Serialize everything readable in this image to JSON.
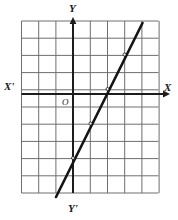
{
  "figure": {
    "kind": "coordinate-plane-line-graph",
    "title": "",
    "background_color": "#ffffff",
    "grid": {
      "line_color": "#6e6e6e",
      "line_width": 1,
      "cell_size_px": 17.2,
      "columns": 8,
      "rows": 10,
      "bounds_px": {
        "left": 21.5,
        "top": 21.0,
        "right": 158.5,
        "bottom": 193.0
      }
    },
    "axes": {
      "color": "#1d1d1d",
      "line_width": 2,
      "origin_px": {
        "x": 73.0,
        "y": 94.0
      },
      "x_axis": {
        "y_px": 94.0,
        "x_start_px": 21.5,
        "x_end_px": 170.0,
        "arrow": "right"
      },
      "y_axis": {
        "x_px": 73.0,
        "y_start_px": 193.0,
        "y_end_px": 17.0,
        "arrow": "up"
      }
    },
    "labels": {
      "x_positive": "X",
      "x_negative": "X'",
      "y_positive": "Y",
      "y_negative": "Y'",
      "origin": "O"
    },
    "line": {
      "color": "#141414",
      "width": 2.6,
      "start_px": {
        "x": 56.0,
        "y": 197.0
      },
      "end_px": {
        "x": 142.5,
        "y": 23.0
      },
      "marked_points_px": [
        {
          "x": 73.0,
          "y": 158.0
        },
        {
          "x": 90.5,
          "y": 123.5
        },
        {
          "x": 107.5,
          "y": 89.0
        },
        {
          "x": 124.5,
          "y": 54.5
        }
      ]
    }
  },
  "chart_data": {
    "type": "line",
    "title": "",
    "xlabel": "X",
    "ylabel": "Y",
    "xlim": [
      -3,
      5
    ],
    "ylim": [
      -5.5,
      4.5
    ],
    "grid": true,
    "legend": null,
    "axis_labels": {
      "x_positive": "X",
      "x_negative": "X'",
      "y_positive": "Y",
      "y_negative": "Y'",
      "origin": "O"
    },
    "tick_labels": {
      "x": [],
      "y": []
    },
    "series": [
      {
        "name": "line",
        "equation": "y = 2x - 4",
        "slope": 2,
        "y_intercept": -4,
        "x_intercept": 2,
        "x": [
          -1,
          0,
          1,
          2,
          3,
          4
        ],
        "y": [
          -6,
          -4,
          -2,
          0,
          2,
          4
        ],
        "marked_points": [
          {
            "x": 0,
            "y": -4
          },
          {
            "x": 1,
            "y": -2
          },
          {
            "x": 2,
            "y": 0
          },
          {
            "x": 3,
            "y": 2
          }
        ]
      }
    ],
    "annotations": []
  }
}
